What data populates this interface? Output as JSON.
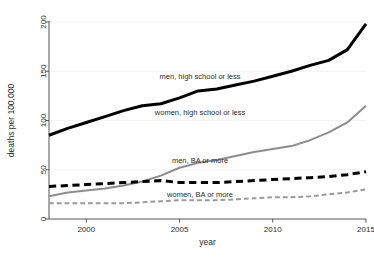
{
  "chart_data": {
    "type": "line",
    "title": "",
    "xlabel": "year",
    "ylabel": "deaths per 100,000",
    "xlim": [
      1998,
      2015
    ],
    "ylim": [
      0,
      200
    ],
    "xticks": [
      2000,
      2005,
      2010,
      2015
    ],
    "xtick_labels": [
      "2000",
      "2005",
      "2010",
      "2015"
    ],
    "yticks": [
      0,
      50,
      100,
      150,
      200
    ],
    "ytick_labels": [
      "0",
      "50",
      "100",
      "150",
      "200"
    ],
    "grid": true,
    "legend_position": "inline-annotations",
    "x": [
      1998,
      1999,
      2000,
      2001,
      2002,
      2003,
      2004,
      2005,
      2006,
      2007,
      2008,
      2009,
      2010,
      2011,
      2012,
      2013,
      2014,
      2015
    ],
    "series": [
      {
        "name": "men, high school or less",
        "style": "solid",
        "color": "#000000",
        "width": 3.0,
        "label_x": 2006.1,
        "label_y": 142,
        "values": [
          85,
          92,
          98,
          104,
          110,
          115,
          117,
          123,
          130,
          132,
          136,
          140,
          145,
          150,
          156,
          161,
          172,
          198
        ]
      },
      {
        "name": "women, high school or less",
        "style": "solid",
        "color": "#8c8c8c",
        "width": 2.0,
        "label_x": 2006.1,
        "label_y": 106,
        "values": [
          23,
          27,
          29,
          31,
          34,
          38,
          44,
          52,
          57,
          60,
          64,
          68,
          71,
          74,
          80,
          88,
          98,
          115
        ]
      },
      {
        "name": "men, BA or more",
        "style": "dashed",
        "color": "#000000",
        "width": 3.0,
        "label_x": 2006.1,
        "label_y": 57,
        "values": [
          33,
          34,
          35,
          36,
          37,
          38,
          39,
          37,
          37,
          37,
          38,
          39,
          40,
          41,
          42,
          43,
          45,
          48
        ]
      },
      {
        "name": "women, BA or more",
        "style": "dashed",
        "color": "#9a9a9a",
        "width": 2.0,
        "label_x": 2006.1,
        "label_y": 22,
        "values": [
          16,
          16,
          16,
          16,
          16,
          17,
          18,
          19,
          19,
          19,
          20,
          21,
          22,
          22,
          23,
          25,
          27,
          30
        ]
      }
    ]
  }
}
